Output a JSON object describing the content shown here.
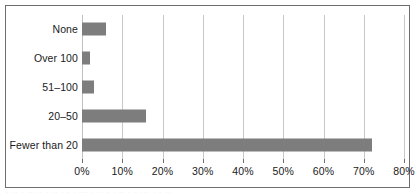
{
  "chart_data": {
    "type": "bar",
    "orientation": "horizontal",
    "title": "",
    "subtitle": "",
    "xlabel": "",
    "ylabel": "",
    "categories": [
      "None",
      "Over 100",
      "51–100",
      "20–50",
      "Fewer than 20"
    ],
    "values": [
      6,
      2,
      3,
      16,
      72
    ],
    "series": [
      {
        "name": "Percentage of respondents",
        "values": [
          6,
          2,
          3,
          16,
          72
        ]
      }
    ],
    "xlim": [
      0,
      80
    ],
    "ylim": null,
    "xticks": [
      0,
      10,
      20,
      30,
      40,
      50,
      60,
      70,
      80
    ],
    "xticklabels": [
      "0%",
      "10%",
      "20%",
      "30%",
      "40%",
      "50%",
      "60%",
      "70%",
      "80%"
    ],
    "value_suffix": "%",
    "grid": "vertical",
    "legend": null,
    "legend_position": "none",
    "annotations": []
  },
  "style": {
    "bar_color": "#7d7d7d",
    "gridline_color": "#c8c8c8",
    "axis_color": "#6e6e6e",
    "frame_color": "#6e6e6e",
    "text_color": "#1a1a1a",
    "background": "#ffffff"
  },
  "artifact": {
    "bleed_text": "· ·· · ··· · · ·· · · · ··· · ·· · · ·· · · ··· · · ··"
  }
}
